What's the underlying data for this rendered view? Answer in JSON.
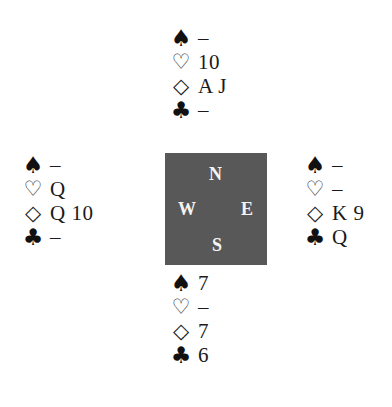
{
  "icons": {
    "spade": "♠",
    "heart": "♡",
    "diamond": "◇",
    "club": "♣"
  },
  "compass": {
    "north": "N",
    "west": "W",
    "east": "E",
    "south": "S",
    "background_color": "#585858"
  },
  "hands": {
    "north": {
      "spades": "–",
      "hearts": "10",
      "diamonds": "A J",
      "clubs": "–"
    },
    "west": {
      "spades": "–",
      "hearts": "Q",
      "diamonds": "Q 10",
      "clubs": "–"
    },
    "east": {
      "spades": "–",
      "hearts": "–",
      "diamonds": "K 9",
      "clubs": "Q"
    },
    "south": {
      "spades": "7",
      "hearts": "–",
      "diamonds": "7",
      "clubs": "6"
    }
  }
}
